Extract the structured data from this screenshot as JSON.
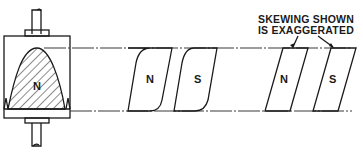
{
  "diagram": {
    "rotor": {
      "pole_label": "N"
    },
    "middle_poles": [
      {
        "label": "N"
      },
      {
        "label": "S"
      }
    ],
    "right_poles": [
      {
        "label": "N"
      },
      {
        "label": "S"
      }
    ],
    "annotation": {
      "line1": "SKEWING SHOWN",
      "line2": "IS EXAGGERATED"
    },
    "colors": {
      "ink": "#1a1a1a",
      "background": "#ffffff"
    }
  }
}
